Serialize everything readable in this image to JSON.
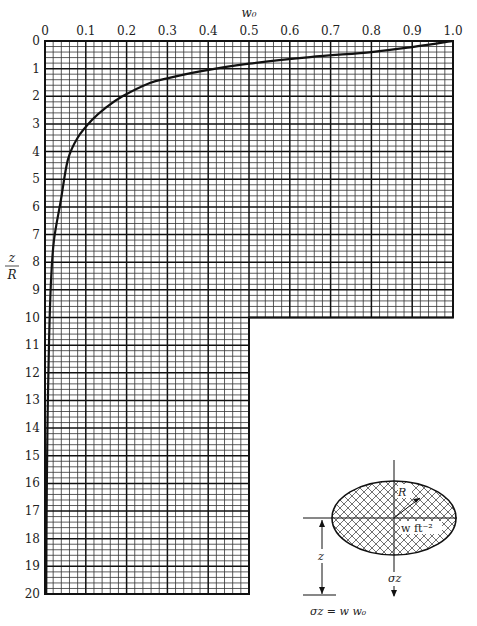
{
  "chart_data": {
    "type": "line",
    "title": "",
    "xlabel": "w0",
    "ylabel": "z/R",
    "x_axis_position": "top",
    "y_axis_inverted": true,
    "xlim": [
      0,
      1.0
    ],
    "ylim": [
      0,
      20
    ],
    "x_ticks": [
      "0",
      "0.1",
      "0.2",
      "0.3",
      "0.4",
      "0.5",
      "0.6",
      "0.7",
      "0.8",
      "0.9",
      "1.0"
    ],
    "y_ticks": [
      "0",
      "1",
      "2",
      "3",
      "4",
      "5",
      "6",
      "7",
      "8",
      "9",
      "10",
      "11",
      "12",
      "13",
      "14",
      "15",
      "16",
      "17",
      "18",
      "19",
      "20"
    ],
    "grid": true,
    "grid_layout": "upper region w0 0-1.0 for z/R 0-10; lower region w0 0-0.5 for z/R 10-20; minor divisions 0.02 in w0 and 0.2 in z/R",
    "series": [
      {
        "name": "w0 influence curve",
        "x": [
          1.0,
          0.9,
          0.8,
          0.65,
          0.5,
          0.38,
          0.3,
          0.257,
          0.19,
          0.15,
          0.115,
          0.08,
          0.056,
          0.039,
          0.022,
          0.015,
          0.01,
          0.006,
          0.004,
          0.003
        ],
        "y": [
          0,
          0.22,
          0.4,
          0.58,
          0.82,
          1.1,
          1.35,
          1.52,
          2.0,
          2.4,
          2.86,
          3.5,
          4.3,
          5.75,
          7.2,
          8.6,
          10.8,
          14.0,
          17.0,
          20.0
        ]
      }
    ],
    "inset": {
      "labels": {
        "radius": "R",
        "load": "w ft⁻²",
        "depth": "z",
        "stress": "σz",
        "formula": "σz = w w0"
      }
    }
  },
  "labels": {
    "x_title": "w₀",
    "y_title_num": "z",
    "y_title_den": "R",
    "inset_radius": "R",
    "inset_load": "w ft⁻²",
    "inset_depth": "z",
    "inset_stress": "σz",
    "inset_formula": "σz = w w₀"
  }
}
